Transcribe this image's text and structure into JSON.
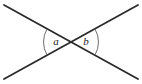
{
  "figure": {
    "type": "vertical-angles-diagram",
    "background_color": "#ffffff",
    "stroke_color": "#2b2b2b",
    "arc_color": "#6e6e6e",
    "label_color": "#1a1a1a",
    "intersection": {
      "x": 71,
      "y": 42
    },
    "lines": [
      {
        "name": "line-top-left-to-bottom-right",
        "x1": 4,
        "y1": 5,
        "x2": 138,
        "y2": 79,
        "stroke_width": 1.8
      },
      {
        "name": "line-bottom-left-to-top-right",
        "x1": 4,
        "y1": 79,
        "x2": 138,
        "y2": 5,
        "stroke_width": 1.8
      }
    ],
    "arcs": [
      {
        "name": "angle-arc-a",
        "side": "left",
        "path": "M 47 29 A 26 26 0 0 0 47 55",
        "stroke_width": 1.0
      },
      {
        "name": "angle-arc-b",
        "side": "right",
        "path": "M 95 29 A 26 26 0 0 1 95 55",
        "stroke_width": 1.0
      }
    ],
    "labels": [
      {
        "name": "angle-label-a",
        "text": "a",
        "x": 56,
        "y": 42
      },
      {
        "name": "angle-label-b",
        "text": "b",
        "x": 86,
        "y": 42
      }
    ]
  }
}
